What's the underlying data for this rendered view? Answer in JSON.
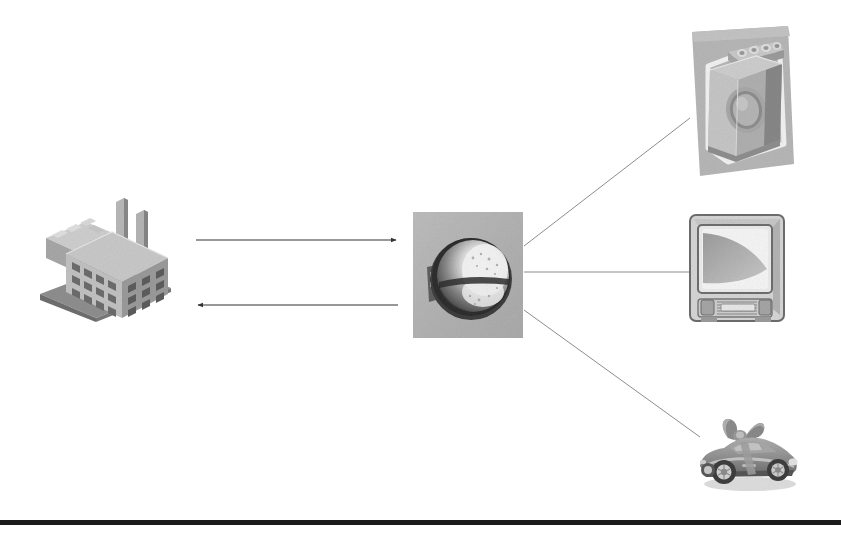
{
  "page": {
    "background_color": "#ffffff",
    "width": 841,
    "height": 538
  },
  "diagram": {
    "type": "flow-diagram",
    "nodes": [
      {
        "id": "factory",
        "label": "Factory",
        "icon": "factory-icon",
        "description": "Isometric industrial factory building with two smokestacks",
        "x": 38,
        "y": 196,
        "width": 135,
        "height": 126,
        "style": "grayscale-photo"
      },
      {
        "id": "steel-component",
        "label": "Steel component",
        "icon": "steel-bearing-icon",
        "description": "Close-up photo of a polished metal sphere / bearing on a gray tile",
        "x": 413,
        "y": 212,
        "width": 110,
        "height": 126,
        "style": "grayscale-photo-tile",
        "tile_color": "#b4b4b4"
      },
      {
        "id": "washing-machine",
        "label": "Washing machine",
        "icon": "washing-machine-icon",
        "description": "Front-loading washing machine on a tilted gray panel",
        "x": 684,
        "y": 26,
        "width": 112,
        "height": 150,
        "style": "grayscale-photo",
        "tile_color": "#b9b9b9"
      },
      {
        "id": "television",
        "label": "Television",
        "icon": "crt-television-icon",
        "description": "CRT television set with a gray screen gradient",
        "x": 687,
        "y": 211,
        "width": 104,
        "height": 116,
        "style": "grayscale-photo"
      },
      {
        "id": "sports-car",
        "label": "Sports car",
        "icon": "sports-car-icon",
        "description": "Convertible sports car wrapped with a gift ribbon and bow",
        "x": 694,
        "y": 408,
        "width": 108,
        "height": 88,
        "style": "grayscale-photo"
      }
    ],
    "connectors": [
      {
        "id": "factory-to-component",
        "from": "factory",
        "to": "steel-component",
        "kind": "arrow",
        "direction": "right",
        "x1": 196,
        "y1": 240,
        "x2": 398,
        "y2": 240,
        "color": "#333333",
        "width": 1.2
      },
      {
        "id": "component-to-factory",
        "from": "steel-component",
        "to": "factory",
        "kind": "arrow",
        "direction": "left",
        "x1": 398,
        "y1": 305,
        "x2": 196,
        "y2": 305,
        "color": "#333333",
        "width": 1.2
      },
      {
        "id": "component-to-washing-machine",
        "from": "steel-component",
        "to": "washing-machine",
        "kind": "line",
        "direction": "none",
        "x1": 524,
        "y1": 246,
        "x2": 690,
        "y2": 118,
        "color": "#8d8d8d",
        "width": 1
      },
      {
        "id": "component-to-television",
        "from": "steel-component",
        "to": "television",
        "kind": "line",
        "direction": "none",
        "x1": 524,
        "y1": 272,
        "x2": 690,
        "y2": 272,
        "color": "#8d8d8d",
        "width": 1
      },
      {
        "id": "component-to-sports-car",
        "from": "steel-component",
        "to": "sports-car",
        "kind": "line",
        "direction": "none",
        "x1": 524,
        "y1": 310,
        "x2": 700,
        "y2": 437,
        "color": "#8d8d8d",
        "width": 1
      }
    ],
    "rule": {
      "id": "bottom-rule",
      "y": 520,
      "height": 5,
      "color": "#1b1b1b"
    }
  }
}
